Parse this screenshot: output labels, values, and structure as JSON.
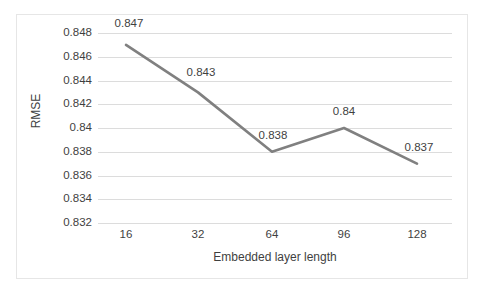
{
  "chart_data": {
    "type": "line",
    "title": "",
    "xlabel": "Embedded layer length",
    "ylabel": "RMSE",
    "categories": [
      "16",
      "32",
      "64",
      "96",
      "128"
    ],
    "values": [
      0.847,
      0.843,
      0.838,
      0.84,
      0.837
    ],
    "data_labels": [
      "0.847",
      "0.843",
      "0.838",
      "0.84",
      "0.837"
    ],
    "series": [
      {
        "name": "RMSE",
        "values": [
          0.847,
          0.843,
          0.838,
          0.84,
          0.837
        ],
        "color": "#808080"
      }
    ],
    "ylim": [
      0.832,
      0.848
    ],
    "ytick_labels": [
      "0.848",
      "0.846",
      "0.844",
      "0.842",
      "0.84",
      "0.838",
      "0.836",
      "0.834",
      "0.832"
    ],
    "ytick_values": [
      0.848,
      0.846,
      0.844,
      0.842,
      0.84,
      0.838,
      0.836,
      0.834,
      0.832
    ],
    "xtick_labels": [
      "16",
      "32",
      "64",
      "96",
      "128"
    ],
    "grid": "horizontal",
    "legend": "none",
    "gridline_color": "#dcdcdc",
    "text_color": "#3f3f3f",
    "border_color": "#e6e6e6",
    "background": "#ffffff"
  }
}
